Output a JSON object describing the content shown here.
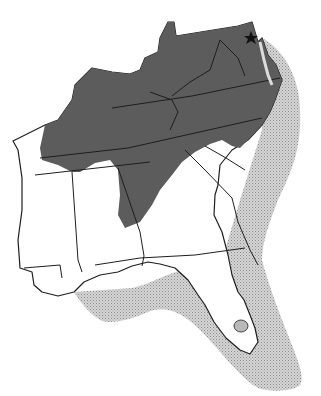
{
  "map": {
    "type": "species range map",
    "region": "Southeastern United States",
    "legend": [],
    "fills": {
      "inland_range": "#5c5c5c",
      "coastal_zone": "#bdbdbd",
      "land": "#ffffff",
      "outline": "#1e1e1e"
    },
    "markers": [
      {
        "symbol": "star",
        "position": "near Washington DC / Maryland"
      }
    ],
    "states_depicted": [
      "Kentucky",
      "West Virginia",
      "Virginia",
      "Maryland",
      "Delaware",
      "Tennessee",
      "North Carolina",
      "South Carolina",
      "Georgia",
      "Alabama",
      "Mississippi",
      "Florida"
    ]
  }
}
